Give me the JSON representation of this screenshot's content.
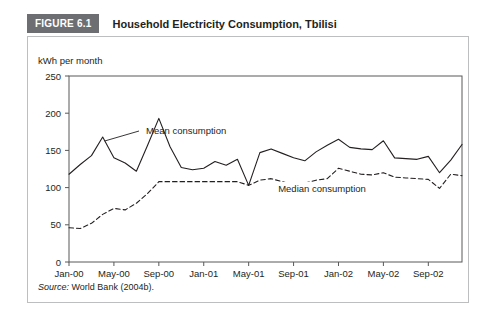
{
  "figure": {
    "badge": "FIGURE 6.1",
    "title": "Household Electricity Consumption, Tbilisi",
    "source_label": "Source:",
    "source_text": " World Bank (2004b)."
  },
  "chart_data": {
    "type": "line",
    "title": "Household Electricity Consumption, Tbilisi",
    "subtitle": "",
    "xlabel": "",
    "ylabel": "kWh per month",
    "ylim": [
      0,
      250
    ],
    "yticks": [
      0,
      50,
      100,
      150,
      200,
      250
    ],
    "ytick_labels": [
      "0",
      "50",
      "100",
      "150",
      "200",
      "250"
    ],
    "grid": false,
    "legend_position": "inline-annotation",
    "x": [
      "Jan-00",
      "Feb-00",
      "Mar-00",
      "Apr-00",
      "May-00",
      "Jun-00",
      "Jul-00",
      "Aug-00",
      "Sep-00",
      "Oct-00",
      "Nov-00",
      "Dec-00",
      "Jan-01",
      "Feb-01",
      "Mar-01",
      "Apr-01",
      "May-01",
      "Jun-01",
      "Jul-01",
      "Aug-01",
      "Sep-01",
      "Oct-01",
      "Nov-01",
      "Dec-01",
      "Jan-02",
      "Feb-02",
      "Mar-02",
      "Apr-02",
      "May-02",
      "Jun-02",
      "Jul-02",
      "Aug-02",
      "Sep-02",
      "Oct-02",
      "Nov-02",
      "Dec-02"
    ],
    "xticks": [
      "Jan-00",
      "May-00",
      "Sep-00",
      "Jan-01",
      "May-01",
      "Sep-01",
      "Jan-02",
      "May-02",
      "Sep-02"
    ],
    "xtick_indices": [
      0,
      4,
      8,
      12,
      16,
      20,
      24,
      28,
      32
    ],
    "series": [
      {
        "name": "Mean consumption",
        "style": "solid",
        "color": "#231f20",
        "label_x_index": 9,
        "values": [
          118,
          131,
          143,
          168,
          140,
          133,
          122,
          157,
          193,
          155,
          127,
          124,
          126,
          135,
          130,
          138,
          103,
          147,
          152,
          146,
          140,
          136,
          148,
          157,
          165,
          154,
          152,
          151,
          163,
          140,
          139,
          138,
          142,
          120,
          137,
          158
        ]
      },
      {
        "name": "Median consumption",
        "style": "dashed",
        "color": "#231f20",
        "label_x_index": 22,
        "values": [
          46,
          45,
          52,
          64,
          72,
          70,
          79,
          92,
          108,
          108,
          108,
          108,
          108,
          108,
          108,
          108,
          103,
          110,
          112,
          108,
          104,
          106,
          110,
          112,
          126,
          122,
          118,
          117,
          120,
          114,
          113,
          112,
          111,
          99,
          118,
          116
        ]
      }
    ]
  }
}
